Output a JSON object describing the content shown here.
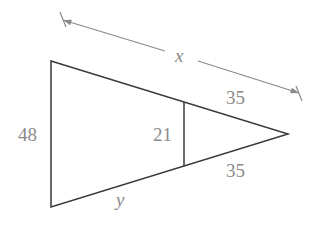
{
  "diagram": {
    "type": "similar-triangles",
    "labels": {
      "x": "x",
      "y": "y",
      "left_side": "48",
      "inner_segment": "21",
      "upper_right": "35",
      "lower_right": "35"
    },
    "colors": {
      "shape": "#3a3a3a",
      "dimension": "#8a8a8a",
      "text": "#8a8a8a"
    }
  }
}
